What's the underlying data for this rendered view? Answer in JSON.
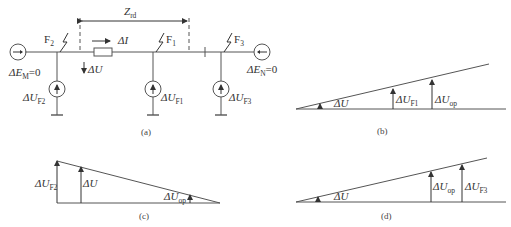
{
  "figure": {
    "panel_a": {
      "caption": "(a)",
      "impedance_label": "Z",
      "impedance_sub": "rd",
      "current_label": "ΔI",
      "voltage_label": "ΔU",
      "fault_points": [
        {
          "name": "F",
          "sub": "2"
        },
        {
          "name": "F",
          "sub": "1"
        },
        {
          "name": "F",
          "sub": "3"
        }
      ],
      "sources": [
        {
          "label": "ΔU",
          "sub": "F2"
        },
        {
          "label": "ΔU",
          "sub": "F1"
        },
        {
          "label": "ΔU",
          "sub": "F3"
        }
      ],
      "emf_left": {
        "pre": "ΔE",
        "sub": "M",
        "post": "=0"
      },
      "emf_right": {
        "pre": "ΔE",
        "sub": "N",
        "post": "=0"
      }
    },
    "panel_b": {
      "caption": "(b)",
      "labels": [
        {
          "pre": "ΔU",
          "sub": ""
        },
        {
          "pre": "ΔU",
          "sub": "F1"
        },
        {
          "pre": "ΔU",
          "sub": "op"
        }
      ]
    },
    "panel_c": {
      "caption": "(c)",
      "labels": [
        {
          "pre": "ΔU",
          "sub": "F2"
        },
        {
          "pre": "ΔU",
          "sub": ""
        },
        {
          "pre": "ΔU",
          "sub": "op"
        }
      ]
    },
    "panel_d": {
      "caption": "(d)",
      "labels": [
        {
          "pre": "ΔU",
          "sub": ""
        },
        {
          "pre": "ΔU",
          "sub": "op"
        },
        {
          "pre": "ΔU",
          "sub": "F3"
        }
      ]
    }
  }
}
